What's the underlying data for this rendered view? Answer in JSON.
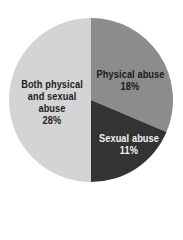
{
  "chart_data": {
    "type": "pie",
    "title": "",
    "categories": [
      "Physical abuse",
      "Sexual abuse",
      "Both physical and sexual abuse"
    ],
    "values": [
      18,
      11,
      28
    ],
    "value_unit": "%",
    "labels": [
      {
        "lines": [
          "Physical abuse",
          "18%"
        ]
      },
      {
        "lines": [
          "Sexual abuse",
          "11%"
        ]
      },
      {
        "lines": [
          "Both physical",
          "and sexual",
          "abuse",
          "28%"
        ]
      }
    ],
    "colors": [
      "#8c8c8c",
      "#333333",
      "#d4d4d4"
    ],
    "labeled_total_percent": 57,
    "rendered_geometry": {
      "note": "The printed labels add up to 57%. The drawn wedges are not sized to those labels: the three categories are renormalized to fill the whole circle, so each wedge shows its share of the labeled subset, not the printed percentage. The remaining 43% of the base population is not shown.",
      "angle_units": "degrees, measured clockwise from 12 o'clock",
      "slices": [
        {
          "category": "Physical abuse",
          "start": 0,
          "end": 113,
          "approx_share_of_circle": 0.31
        },
        {
          "category": "Sexual abuse",
          "start": 113,
          "end": 180,
          "approx_share_of_circle": 0.19
        },
        {
          "category": "Both physical and sexual abuse",
          "start": 180,
          "end": 360,
          "approx_share_of_circle": 0.5
        }
      ]
    },
    "center": [
      91,
      100
    ],
    "radius": 82,
    "legend": "none (labels drawn inside slices)"
  },
  "background": "#ffffff"
}
